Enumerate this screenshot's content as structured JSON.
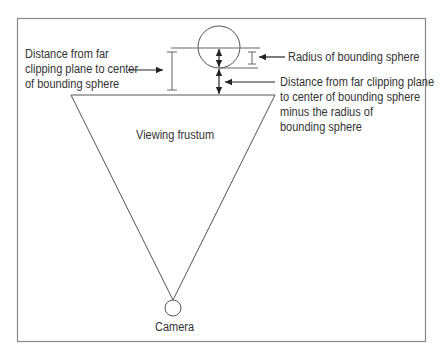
{
  "diagram": {
    "type": "frustum-culling-illustration",
    "labels": {
      "distance_center": [
        "Distance from far",
        "clipping plane to center",
        "of bounding sphere"
      ],
      "radius": "Radius of bounding sphere",
      "distance_minus_radius": [
        "Distance from far clipping plane",
        "to center of bounding sphere",
        "minus the radius of",
        "bounding sphere"
      ],
      "frustum": "Viewing frustum",
      "camera": "Camera"
    },
    "colors": {
      "line": "#555555",
      "text": "#333333",
      "frame": "#888888"
    }
  }
}
